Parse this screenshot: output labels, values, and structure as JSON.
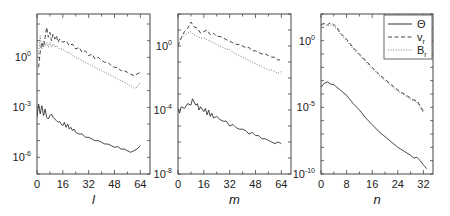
{
  "chart_data": [
    {
      "type": "line",
      "title": "",
      "xlabel": "l",
      "ylabel": "",
      "yscale": "log",
      "xlim": [
        0,
        70
      ],
      "ylim_log10": [
        -7,
        2.6
      ],
      "xticks": [
        0,
        16,
        32,
        48,
        64
      ],
      "yticks": [
        {
          "log10": 0,
          "base": "10",
          "exp": "0"
        },
        {
          "log10": -3,
          "base": "10",
          "exp": "-3"
        },
        {
          "log10": -6,
          "base": "10",
          "exp": "-6"
        }
      ],
      "series": [
        {
          "name": "v_r",
          "style": "dashed",
          "x": [
            1,
            2,
            3,
            4,
            5,
            6,
            7,
            8,
            9,
            10,
            11,
            12,
            13,
            14,
            16,
            18,
            20,
            22,
            24,
            26,
            28,
            30,
            32,
            34,
            36,
            38,
            40,
            42,
            44,
            46,
            48,
            50,
            52,
            54,
            56,
            58,
            60,
            62,
            64
          ],
          "log10_values": [
            -0.6,
            0.3,
            0.9,
            0.6,
            1.2,
            1.8,
            1.2,
            1.5,
            1.0,
            1.4,
            1.1,
            1.3,
            0.9,
            1.1,
            0.9,
            1.0,
            0.7,
            0.8,
            0.5,
            0.6,
            0.3,
            0.4,
            0.1,
            0.2,
            -0.1,
            0.0,
            -0.2,
            -0.3,
            -0.3,
            -0.5,
            -0.6,
            -0.6,
            -0.8,
            -0.8,
            -0.9,
            -1.0,
            -1.1,
            -1.0,
            -0.9
          ]
        },
        {
          "name": "B_r",
          "style": "dotted",
          "x": [
            1,
            2,
            3,
            4,
            5,
            6,
            7,
            8,
            9,
            10,
            11,
            12,
            14,
            16,
            18,
            20,
            22,
            24,
            26,
            28,
            30,
            32,
            34,
            36,
            38,
            40,
            42,
            44,
            46,
            48,
            50,
            52,
            54,
            56,
            58,
            60,
            62,
            64
          ],
          "log10_values": [
            0.2,
            1.3,
            0.5,
            1.0,
            0.7,
            0.9,
            0.6,
            0.9,
            0.6,
            0.8,
            0.6,
            0.7,
            0.5,
            0.5,
            0.3,
            0.3,
            0.1,
            0.0,
            -0.1,
            -0.2,
            -0.3,
            -0.4,
            -0.5,
            -0.6,
            -0.7,
            -0.8,
            -0.9,
            -1.0,
            -1.1,
            -1.2,
            -1.3,
            -1.4,
            -1.5,
            -1.6,
            -1.7,
            -1.85,
            -1.8,
            -1.5
          ]
        },
        {
          "name": "Θ",
          "style": "solid",
          "x": [
            0,
            1,
            2,
            3,
            4,
            5,
            6,
            7,
            8,
            9,
            10,
            11,
            12,
            13,
            14,
            15,
            16,
            17,
            18,
            19,
            20,
            21,
            22,
            23,
            24,
            26,
            28,
            30,
            32,
            34,
            36,
            38,
            40,
            42,
            44,
            46,
            48,
            50,
            52,
            54,
            56,
            58,
            60,
            62,
            64
          ],
          "log10_values": [
            -3.6,
            -2.8,
            -3.4,
            -2.9,
            -3.5,
            -3.1,
            -3.6,
            -3.7,
            -3.5,
            -3.4,
            -3.6,
            -3.7,
            -3.8,
            -3.9,
            -3.85,
            -4.0,
            -4.1,
            -3.9,
            -4.2,
            -4.0,
            -4.3,
            -4.2,
            -4.4,
            -4.3,
            -4.5,
            -4.6,
            -4.6,
            -4.8,
            -4.8,
            -4.9,
            -5.0,
            -5.0,
            -5.1,
            -5.2,
            -5.2,
            -5.3,
            -5.4,
            -5.35,
            -5.5,
            -5.5,
            -5.6,
            -5.7,
            -5.6,
            -5.5,
            -5.3
          ]
        }
      ]
    },
    {
      "type": "line",
      "title": "",
      "xlabel": "m",
      "ylabel": "",
      "yscale": "log",
      "xlim": [
        0,
        70
      ],
      "ylim_log10": [
        -8,
        2
      ],
      "xticks": [
        0,
        16,
        32,
        48,
        64
      ],
      "yticks": [
        {
          "log10": 0,
          "base": "10",
          "exp": "0"
        },
        {
          "log10": -4,
          "base": "10",
          "exp": "-4"
        },
        {
          "log10": -8,
          "base": "10",
          "exp": "-8"
        }
      ],
      "series": [
        {
          "name": "v_r",
          "style": "dashed",
          "x": [
            0,
            2,
            4,
            6,
            8,
            10,
            12,
            14,
            16,
            18,
            20,
            22,
            24,
            26,
            28,
            30,
            32,
            34,
            36,
            38,
            40,
            42,
            44,
            46,
            48,
            50,
            52,
            54,
            56,
            58,
            60,
            62,
            64
          ],
          "log10_values": [
            0.0,
            0.5,
            0.9,
            1.1,
            1.5,
            1.2,
            1.1,
            0.8,
            0.9,
            1.0,
            0.7,
            0.8,
            0.6,
            0.6,
            0.5,
            0.4,
            0.3,
            0.2,
            0.1,
            0.1,
            0.0,
            -0.1,
            -0.1,
            -0.3,
            -0.3,
            -0.4,
            -0.5,
            -0.5,
            -0.6,
            -0.7,
            -0.7,
            -0.9,
            -0.8
          ]
        },
        {
          "name": "B_r",
          "style": "dotted",
          "x": [
            0,
            2,
            4,
            6,
            8,
            10,
            12,
            14,
            16,
            18,
            20,
            22,
            24,
            26,
            28,
            30,
            32,
            34,
            36,
            38,
            40,
            42,
            44,
            46,
            48,
            50,
            52,
            54,
            56,
            58,
            60,
            62,
            64
          ],
          "log10_values": [
            0.3,
            0.5,
            0.7,
            0.8,
            0.9,
            0.7,
            0.6,
            0.5,
            0.5,
            0.4,
            0.3,
            0.2,
            0.1,
            0.0,
            -0.1,
            -0.2,
            -0.2,
            -0.4,
            -0.5,
            -0.6,
            -0.7,
            -0.8,
            -0.9,
            -1.0,
            -1.1,
            -1.2,
            -1.3,
            -1.4,
            -1.5,
            -1.5,
            -1.6,
            -1.7,
            -1.6
          ]
        },
        {
          "name": "Θ",
          "style": "solid",
          "x": [
            0,
            1,
            2,
            4,
            6,
            8,
            9,
            10,
            11,
            12,
            13,
            14,
            16,
            17,
            18,
            19,
            20,
            21,
            22,
            24,
            26,
            28,
            30,
            32,
            34,
            36,
            38,
            40,
            42,
            44,
            46,
            48,
            50,
            52,
            54,
            56,
            58,
            60,
            62,
            64
          ],
          "log10_values": [
            -3.9,
            -4.2,
            -3.8,
            -3.9,
            -3.6,
            -3.7,
            -3.3,
            -3.5,
            -3.7,
            -3.6,
            -4.0,
            -3.8,
            -4.1,
            -3.9,
            -4.3,
            -4.0,
            -4.4,
            -4.2,
            -4.5,
            -4.4,
            -4.6,
            -4.7,
            -4.7,
            -5.0,
            -4.9,
            -5.1,
            -5.2,
            -5.2,
            -5.3,
            -5.5,
            -5.4,
            -5.6,
            -5.6,
            -5.8,
            -5.8,
            -5.9,
            -6.0,
            -6.1,
            -6.0,
            -6.1
          ]
        }
      ]
    },
    {
      "type": "line",
      "title": "",
      "xlabel": "n",
      "ylabel": "",
      "yscale": "log",
      "xlim": [
        0,
        35
      ],
      "ylim_log10": [
        -10,
        2
      ],
      "xticks": [
        0,
        8,
        16,
        24,
        32
      ],
      "yticks": [
        {
          "log10": 0,
          "base": "10",
          "exp": "0"
        },
        {
          "log10": -5,
          "base": "10",
          "exp": "-5"
        },
        {
          "log10": -10,
          "base": "10",
          "exp": "-10"
        }
      ],
      "legend": {
        "placement": "top-right",
        "entries": [
          {
            "label": "Θ",
            "sub": "",
            "style": "solid"
          },
          {
            "label": "v",
            "sub": "r",
            "style": "dashed"
          },
          {
            "label": "B",
            "sub": "r",
            "style": "dotted"
          }
        ]
      },
      "series": [
        {
          "name": "v_r",
          "style": "dashed",
          "x": [
            0,
            1,
            2,
            3,
            4,
            5,
            6,
            8,
            10,
            12,
            14,
            16,
            18,
            20,
            22,
            24,
            26,
            28,
            29,
            30,
            31,
            32
          ],
          "log10_values": [
            1.2,
            1.3,
            1.2,
            1.35,
            1.2,
            1.0,
            0.6,
            0.1,
            -0.5,
            -1.0,
            -1.5,
            -2.0,
            -2.5,
            -2.9,
            -3.3,
            -3.7,
            -4.0,
            -4.3,
            -4.45,
            -4.5,
            -4.9,
            -5.3
          ]
        },
        {
          "name": "B_r",
          "style": "dotted",
          "x": [
            0,
            1,
            2,
            3,
            4,
            5,
            6,
            8,
            10,
            12,
            14,
            16,
            18,
            20,
            22,
            24,
            26,
            28,
            29,
            30,
            31,
            32
          ],
          "log10_values": [
            1.1,
            1.2,
            1.1,
            1.2,
            1.05,
            0.9,
            0.5,
            0.0,
            -0.6,
            -1.1,
            -1.6,
            -2.1,
            -2.55,
            -3.0,
            -3.4,
            -3.8,
            -4.1,
            -4.4,
            -4.5,
            -4.65,
            -5.0,
            -5.4
          ]
        },
        {
          "name": "Θ",
          "style": "solid",
          "x": [
            0,
            1,
            2,
            3,
            4,
            5,
            6,
            8,
            10,
            12,
            14,
            16,
            18,
            20,
            22,
            24,
            26,
            28,
            29,
            30,
            31,
            32,
            33
          ],
          "log10_values": [
            -3.5,
            -3.2,
            -3.1,
            -3.25,
            -3.3,
            -3.5,
            -3.7,
            -4.1,
            -4.7,
            -5.2,
            -5.8,
            -6.3,
            -6.8,
            -7.2,
            -7.6,
            -8.0,
            -8.3,
            -8.6,
            -8.8,
            -8.75,
            -9.0,
            -9.3,
            -9.6
          ]
        }
      ]
    }
  ]
}
